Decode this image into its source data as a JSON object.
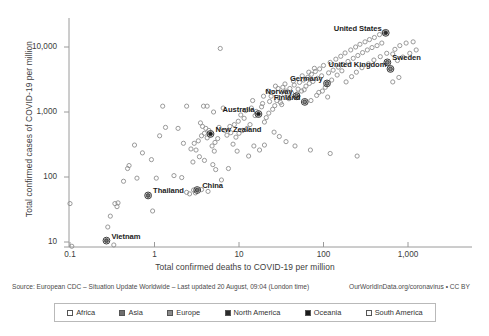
{
  "chart_data": {
    "type": "scatter",
    "title": "",
    "xlabel": "Total confirmed deaths to COVID-19 per million",
    "ylabel": "Total confirmed cases of COVID-19 per million",
    "xscale": "log",
    "yscale": "log",
    "xlim": [
      0.08,
      1600
    ],
    "ylim": [
      7,
      30000
    ],
    "xticks": [
      "0.1",
      "1",
      "10",
      "100",
      "1,000"
    ],
    "xtick_values": [
      0.1,
      1,
      10,
      100,
      1000
    ],
    "yticks": [
      "10",
      "100",
      "1,000",
      "10,000"
    ],
    "ytick_values": [
      10,
      100,
      1000,
      10000
    ],
    "grid": false,
    "legend_position": "bottom",
    "legend": [
      {
        "label": "Africa",
        "fill": "#ffffff"
      },
      {
        "label": "Asia",
        "fill": "#6e6e6e"
      },
      {
        "label": "Europe",
        "fill": "#8a8a8a"
      },
      {
        "label": "North America",
        "fill": "#2b2b2b"
      },
      {
        "label": "Oceania",
        "fill": "#1a1a1a"
      },
      {
        "label": "South America",
        "fill": "#fafafa"
      }
    ],
    "annotations": [
      {
        "label": "United States",
        "x": 545,
        "y": 16500,
        "anchor": "right"
      },
      {
        "label": "Sweden",
        "x": 570,
        "y": 5800,
        "anchor": "left"
      },
      {
        "label": "United Kingdom",
        "x": 620,
        "y": 4600,
        "anchor": "right"
      },
      {
        "label": "Germany",
        "x": 110,
        "y": 2750,
        "anchor": "right"
      },
      {
        "label": "Norway",
        "x": 48,
        "y": 1750,
        "anchor": "right"
      },
      {
        "label": "Finland",
        "x": 60,
        "y": 1430,
        "anchor": "right"
      },
      {
        "label": "Australia",
        "x": 17,
        "y": 930,
        "anchor": "right"
      },
      {
        "label": "New Zealand",
        "x": 4.6,
        "y": 460,
        "anchor": "left"
      },
      {
        "label": "China",
        "x": 3.2,
        "y": 63,
        "anchor": "left"
      },
      {
        "label": "Thailand",
        "x": 0.84,
        "y": 52,
        "anchor": "left"
      },
      {
        "label": "Vietnam",
        "x": 0.27,
        "y": 10.5,
        "anchor": "left"
      }
    ],
    "highlighted_points": [
      {
        "name": "United States",
        "x": 545,
        "y": 16500,
        "continent": "North America"
      },
      {
        "name": "Sweden",
        "x": 570,
        "y": 5800,
        "continent": "Europe"
      },
      {
        "name": "United Kingdom",
        "x": 620,
        "y": 4600,
        "continent": "Europe"
      },
      {
        "name": "Germany",
        "x": 110,
        "y": 2750,
        "continent": "Europe"
      },
      {
        "name": "Norway",
        "x": 48,
        "y": 1750,
        "continent": "Europe"
      },
      {
        "name": "Finland",
        "x": 60,
        "y": 1430,
        "continent": "Europe"
      },
      {
        "name": "Australia",
        "x": 17,
        "y": 930,
        "continent": "Oceania"
      },
      {
        "name": "New Zealand",
        "x": 4.6,
        "y": 460,
        "continent": "Oceania"
      },
      {
        "name": "China",
        "x": 3.2,
        "y": 63,
        "continent": "Asia"
      },
      {
        "name": "Thailand",
        "x": 0.84,
        "y": 52,
        "continent": "Asia"
      },
      {
        "name": "Vietnam",
        "x": 0.27,
        "y": 10.5,
        "continent": "Asia"
      }
    ],
    "points": [
      [
        0.1,
        39
      ],
      [
        0.105,
        8.6
      ],
      [
        0.27,
        10.5
      ],
      [
        0.33,
        9.0
      ],
      [
        0.28,
        17
      ],
      [
        0.3,
        25
      ],
      [
        0.36,
        35
      ],
      [
        0.37,
        40
      ],
      [
        0.34,
        39
      ],
      [
        0.43,
        86
      ],
      [
        0.62,
        96
      ],
      [
        0.84,
        52
      ],
      [
        0.95,
        30
      ],
      [
        1.05,
        96
      ],
      [
        0.92,
        185
      ],
      [
        0.72,
        235
      ],
      [
        0.58,
        310
      ],
      [
        0.5,
        150
      ],
      [
        0.48,
        135
      ],
      [
        1.15,
        430
      ],
      [
        1.35,
        580
      ],
      [
        1.7,
        105
      ],
      [
        2.1,
        98
      ],
      [
        2.4,
        58
      ],
      [
        2.6,
        55
      ],
      [
        2.9,
        63
      ],
      [
        3.2,
        63
      ],
      [
        3.6,
        64
      ],
      [
        4.3,
        60
      ],
      [
        3.05,
        57
      ],
      [
        2.85,
        170
      ],
      [
        3.4,
        205
      ],
      [
        3.1,
        260
      ],
      [
        2.95,
        330
      ],
      [
        3.3,
        360
      ],
      [
        3.6,
        430
      ],
      [
        3.9,
        470
      ],
      [
        4.2,
        400
      ],
      [
        4.6,
        460
      ],
      [
        4.4,
        520
      ],
      [
        4.05,
        560
      ],
      [
        3.7,
        600
      ],
      [
        3.5,
        680
      ],
      [
        4.8,
        300
      ],
      [
        5.2,
        340
      ],
      [
        5.6,
        390
      ],
      [
        5.1,
        250
      ],
      [
        6.2,
        90
      ],
      [
        7.5,
        135
      ],
      [
        8.5,
        320
      ],
      [
        9.2,
        410
      ],
      [
        10,
        470
      ],
      [
        11,
        520
      ],
      [
        8.8,
        640
      ],
      [
        9.8,
        720
      ],
      [
        11.5,
        800
      ],
      [
        12.5,
        560
      ],
      [
        13.5,
        640
      ],
      [
        10.5,
        900
      ],
      [
        12,
        1050
      ],
      [
        14,
        1150
      ],
      [
        15.5,
        880
      ],
      [
        17,
        930
      ],
      [
        16,
        1020
      ],
      [
        18.5,
        1200
      ],
      [
        20,
        700
      ],
      [
        21,
        820
      ],
      [
        22.5,
        960
      ],
      [
        19,
        1350
      ],
      [
        23,
        1450
      ],
      [
        25,
        1100
      ],
      [
        26.5,
        1250
      ],
      [
        28,
        1500
      ],
      [
        24,
        1750
      ],
      [
        30,
        1650
      ],
      [
        32,
        1300
      ],
      [
        34,
        1900
      ],
      [
        36,
        2100
      ],
      [
        38,
        1700
      ],
      [
        40,
        2300
      ],
      [
        42,
        1950
      ],
      [
        45,
        2600
      ],
      [
        48,
        1750
      ],
      [
        50,
        2250
      ],
      [
        52,
        2850
      ],
      [
        55,
        2100
      ],
      [
        58,
        3100
      ],
      [
        60,
        1430
      ],
      [
        62,
        2500
      ],
      [
        65,
        3400
      ],
      [
        68,
        2750
      ],
      [
        72,
        3800
      ],
      [
        75,
        2950
      ],
      [
        80,
        4200
      ],
      [
        85,
        3300
      ],
      [
        90,
        4600
      ],
      [
        95,
        3600
      ],
      [
        100,
        5200
      ],
      [
        110,
        2750
      ],
      [
        115,
        4000
      ],
      [
        120,
        5800
      ],
      [
        130,
        4400
      ],
      [
        140,
        6500
      ],
      [
        150,
        4900
      ],
      [
        160,
        7200
      ],
      [
        170,
        5400
      ],
      [
        180,
        8100
      ],
      [
        195,
        6000
      ],
      [
        210,
        9000
      ],
      [
        225,
        6700
      ],
      [
        240,
        10000
      ],
      [
        255,
        7400
      ],
      [
        270,
        11000
      ],
      [
        290,
        8200
      ],
      [
        310,
        12000
      ],
      [
        330,
        9000
      ],
      [
        350,
        13000
      ],
      [
        375,
        9800
      ],
      [
        400,
        14000
      ],
      [
        430,
        10500
      ],
      [
        460,
        15500
      ],
      [
        490,
        11500
      ],
      [
        520,
        16800
      ],
      [
        545,
        16500
      ],
      [
        570,
        5800
      ],
      [
        620,
        4600
      ],
      [
        660,
        7800
      ],
      [
        700,
        9200
      ],
      [
        750,
        6200
      ],
      [
        800,
        10500
      ],
      [
        870,
        7000
      ],
      [
        950,
        11500
      ],
      [
        1050,
        8000
      ],
      [
        1150,
        12000
      ],
      [
        1250,
        9000
      ],
      [
        5.0,
        1000
      ],
      [
        4.2,
        1230
      ],
      [
        6.5,
        1150
      ],
      [
        3.8,
        1230
      ],
      [
        4.9,
        155
      ],
      [
        7.2,
        440
      ],
      [
        8.0,
        480
      ],
      [
        6.8,
        520
      ],
      [
        5.8,
        580
      ],
      [
        7.8,
        600
      ],
      [
        9.5,
        250
      ],
      [
        13,
        210
      ],
      [
        15,
        300
      ],
      [
        17.5,
        260
      ],
      [
        20,
        310
      ],
      [
        6.0,
        9500
      ],
      [
        2.4,
        1230
      ],
      [
        1.9,
        560
      ],
      [
        26,
        490
      ],
      [
        30,
        420
      ],
      [
        36,
        350
      ],
      [
        46,
        300
      ],
      [
        70,
        260
      ],
      [
        120,
        230
      ],
      [
        250,
        210
      ],
      [
        33,
        2400
      ],
      [
        44,
        3000
      ],
      [
        56,
        3600
      ],
      [
        67,
        4100
      ],
      [
        78,
        4700
      ],
      [
        88,
        2000
      ],
      [
        105,
        2400
      ],
      [
        125,
        3100
      ],
      [
        145,
        3700
      ],
      [
        165,
        4300
      ],
      [
        185,
        2900
      ],
      [
        215,
        3500
      ],
      [
        245,
        4100
      ],
      [
        285,
        4800
      ],
      [
        340,
        5500
      ],
      [
        395,
        6300
      ],
      [
        470,
        7100
      ],
      [
        560,
        8000
      ],
      [
        660,
        2900
      ],
      [
        780,
        3400
      ],
      [
        22,
        2100
      ],
      [
        27,
        2500
      ],
      [
        31,
        1400
      ],
      [
        39,
        1600
      ],
      [
        49,
        1900
      ],
      [
        59,
        2200
      ],
      [
        71,
        1500
      ],
      [
        83,
        1800
      ],
      [
        97,
        2100
      ],
      [
        112,
        1700
      ],
      [
        1.25,
        1230
      ],
      [
        2.2,
        330
      ],
      [
        2.7,
        270
      ],
      [
        3.9,
        180
      ],
      [
        5.3,
        130
      ],
      [
        14.5,
        1500
      ],
      [
        19.5,
        1750
      ],
      [
        24.5,
        2000
      ],
      [
        29,
        2300
      ],
      [
        35,
        2700
      ]
    ]
  },
  "footer": {
    "source_left": "Source: European CDC – Situation Update Worldwide – Last updated 20 August, 09:04 (London time)",
    "source_right": "OurWorldInData.org/coronavirus • CC BY"
  }
}
